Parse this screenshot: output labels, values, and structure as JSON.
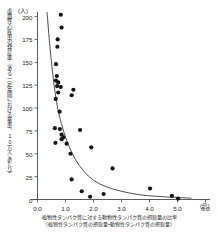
{
  "chart_data": {
    "type": "scatter",
    "title": "",
    "xlabel": "植物性タンパク質に対する動物性タンパク質の摂取量の比率",
    "xlabel_sub": "（植物性タンパク質の摂取量÷動物性タンパク質の摂取量）",
    "ylabel": "虚血性心疾患の発症率（ある一定年間における罹患、10万人あたり）",
    "x_unit": "(倍)",
    "y_unit": "(人)",
    "xlim": [
      0.0,
      6.0
    ],
    "ylim": [
      0,
      205
    ],
    "xticks": [
      "0.0",
      "1.0",
      "2.0",
      "3.0",
      "4.0",
      "5.0",
      "6.0"
    ],
    "xtick_values": [
      0.0,
      1.0,
      2.0,
      3.0,
      4.0,
      5.0,
      6.0
    ],
    "yticks": [
      "0",
      "25",
      "50",
      "75",
      "100",
      "125",
      "150",
      "175",
      "200"
    ],
    "ytick_values": [
      0,
      25,
      50,
      75,
      100,
      125,
      150,
      175,
      200
    ],
    "grid": false,
    "legend": "none",
    "points": [
      [
        0.83,
        202
      ],
      [
        0.86,
        188
      ],
      [
        0.72,
        175
      ],
      [
        0.71,
        167
      ],
      [
        0.66,
        148
      ],
      [
        0.69,
        135
      ],
      [
        0.66,
        130
      ],
      [
        0.74,
        128
      ],
      [
        0.7,
        124
      ],
      [
        0.83,
        123
      ],
      [
        1.28,
        120
      ],
      [
        0.74,
        117
      ],
      [
        1.22,
        114
      ],
      [
        0.65,
        110
      ],
      [
        0.79,
        96
      ],
      [
        0.62,
        78
      ],
      [
        0.8,
        77
      ],
      [
        1.52,
        76
      ],
      [
        0.86,
        71
      ],
      [
        0.93,
        68
      ],
      [
        0.86,
        66
      ],
      [
        0.64,
        62
      ],
      [
        1.04,
        61
      ],
      [
        1.92,
        57
      ],
      [
        1.18,
        50
      ],
      [
        2.68,
        34
      ],
      [
        1.22,
        22
      ],
      [
        4.02,
        12
      ],
      [
        1.58,
        9
      ],
      [
        2.36,
        6
      ],
      [
        4.8,
        4
      ],
      [
        1.88,
        3
      ],
      [
        5.02,
        1
      ]
    ],
    "fit_curve": {
      "description": "decreasing exponential-like trend line",
      "points": [
        [
          0.34,
          205
        ],
        [
          0.45,
          165
        ],
        [
          0.58,
          128
        ],
        [
          0.72,
          100
        ],
        [
          0.9,
          78
        ],
        [
          1.1,
          60
        ],
        [
          1.35,
          44
        ],
        [
          1.65,
          31
        ],
        [
          2.0,
          21
        ],
        [
          2.45,
          14
        ],
        [
          3.0,
          9
        ],
        [
          3.7,
          5
        ],
        [
          4.5,
          3
        ],
        [
          5.5,
          1.5
        ]
      ]
    }
  }
}
